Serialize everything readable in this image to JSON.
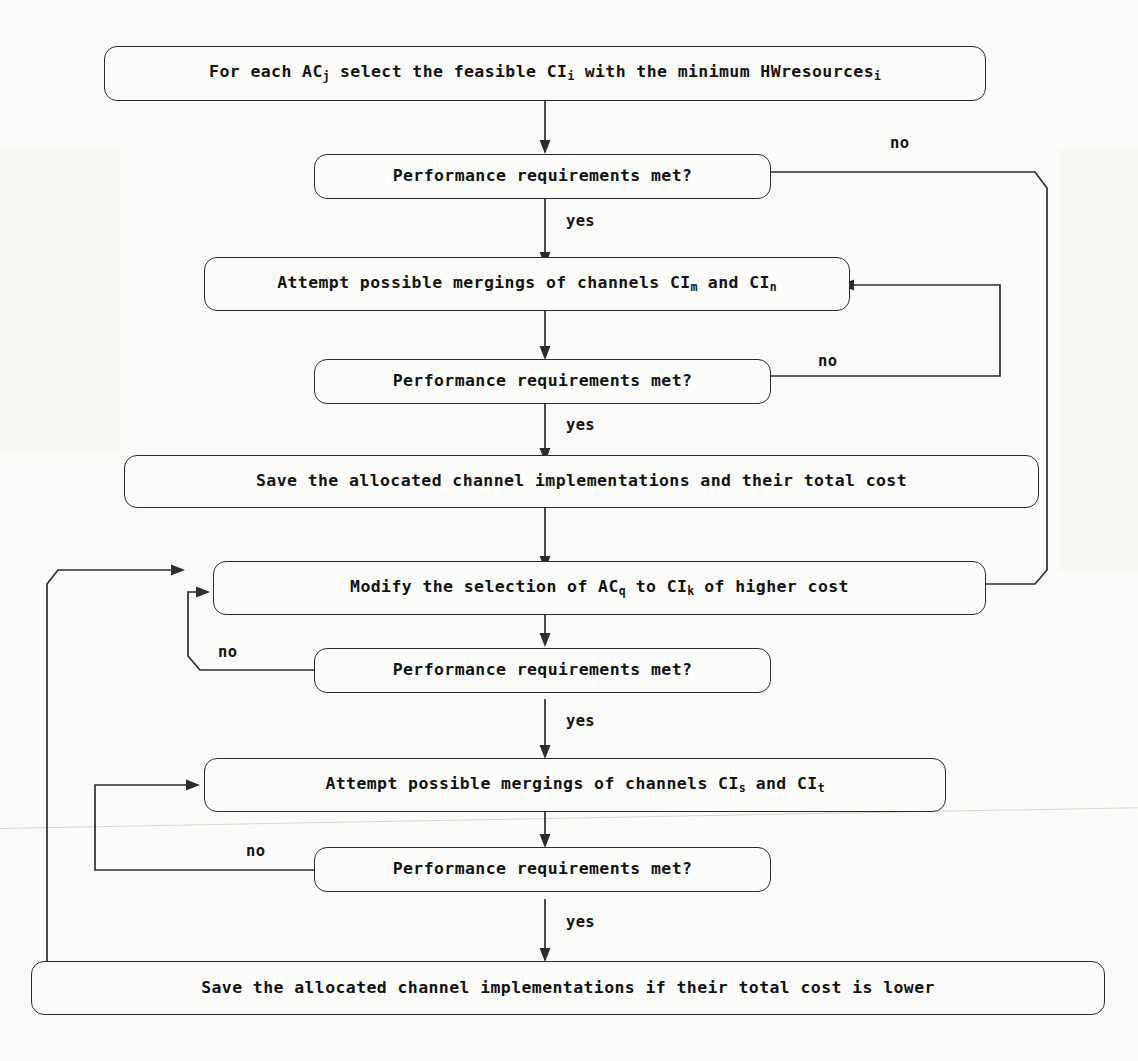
{
  "diagram": {
    "line_color": "#2d2d2d",
    "background_color": "#fdfdfb",
    "nodes": [
      {
        "id": "start",
        "type": "process",
        "text_parts": [
          "For each AC",
          "j",
          " select the feasible CI",
          "i",
          " with the minimum HWresources",
          "i"
        ],
        "plain_text": "For each ACj select the feasible CIi with the minimum HWresourcesi"
      },
      {
        "id": "decision1",
        "type": "decision",
        "plain_text": "Performance requirements met?"
      },
      {
        "id": "merge1",
        "type": "process",
        "text_parts": [
          "Attempt possible mergings of channels CI",
          "m",
          " and CI",
          "n"
        ],
        "plain_text": "Attempt possible mergings of channels CIm and CIn"
      },
      {
        "id": "decision2",
        "type": "decision",
        "plain_text": "Performance requirements met?"
      },
      {
        "id": "save1",
        "type": "process",
        "plain_text": "Save the allocated channel implementations and their total cost"
      },
      {
        "id": "modify",
        "type": "process",
        "text_parts": [
          "Modify the selection of AC ",
          "q",
          " to CI ",
          "k",
          " of higher cost"
        ],
        "plain_text": "Modify the selection of AC q to CI k of higher cost"
      },
      {
        "id": "decision3",
        "type": "decision",
        "plain_text": "Performance requirements met?"
      },
      {
        "id": "merge2",
        "type": "process",
        "text_parts": [
          "Attempt possible mergings of channels CI ",
          "s",
          " and CI ",
          "t"
        ],
        "plain_text": "Attempt possible mergings of channels CI s and CI t"
      },
      {
        "id": "decision4",
        "type": "decision",
        "plain_text": "Performance requirements met?"
      },
      {
        "id": "save2",
        "type": "process",
        "plain_text": "Save the allocated channel implementations if their total cost is lower"
      }
    ],
    "labels": {
      "no1": "no",
      "yes1": "yes",
      "no2": "no",
      "yes2": "yes",
      "no3": "no",
      "yes3": "yes",
      "no4": "no",
      "yes4": "yes"
    },
    "node_text": {
      "start_a": "For each AC",
      "start_sub1": "j",
      "start_b": " select the feasible CI",
      "start_sub2": "i",
      "start_c": " with the minimum HWresources",
      "start_sub3": "i",
      "decision1": "Performance requirements met?",
      "merge1_a": "Attempt possible mergings of channels CI",
      "merge1_sub1": "m",
      "merge1_b": " and CI",
      "merge1_sub2": "n",
      "decision2": "Performance requirements met?",
      "save1": "Save the allocated channel implementations and their total cost",
      "modify_a": "Modify the selection of AC",
      "modify_sub1": "q",
      "modify_b": "to CI",
      "modify_sub2": "k",
      "modify_c": "of higher cost",
      "decision3": "Performance requirements met?",
      "merge2_a": "Attempt possible mergings of channels CI",
      "merge2_sub1": "s",
      "merge2_b": "and CI",
      "merge2_sub2": "t",
      "decision4": "Performance requirements met?",
      "save2": "Save the allocated channel implementations if their total cost is lower"
    }
  }
}
